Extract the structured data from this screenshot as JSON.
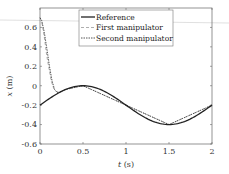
{
  "chart_data": {
    "type": "line",
    "title": "",
    "xlabel": "t (s)",
    "ylabel": "x (m)",
    "xlim": [
      0,
      2
    ],
    "ylim": [
      -0.6,
      0.8
    ],
    "xticks": [
      0,
      0.5,
      1,
      1.5,
      2
    ],
    "xtick_labels": [
      "0",
      "0.5",
      "1",
      "1.5",
      "2"
    ],
    "yticks": [
      -0.6,
      -0.4,
      -0.2,
      0,
      0.2,
      0.4,
      0.6
    ],
    "ytick_labels": [
      "-0.6",
      "-0.4",
      "-0.2",
      "0",
      "0.2",
      "0.4",
      "0.6"
    ],
    "grid": false,
    "legend_position": "upper center",
    "series": [
      {
        "name": "Reference",
        "style": "solid",
        "color": "#222222",
        "x": [
          0,
          0.1,
          0.2,
          0.3,
          0.4,
          0.5,
          0.6,
          0.7,
          0.8,
          0.9,
          1.0,
          1.1,
          1.2,
          1.3,
          1.4,
          1.5,
          1.6,
          1.7,
          1.8,
          1.9,
          2.0
        ],
        "y": [
          -0.2,
          -0.138,
          -0.082,
          -0.038,
          -0.01,
          0.0,
          -0.01,
          -0.038,
          -0.082,
          -0.138,
          -0.2,
          -0.262,
          -0.318,
          -0.362,
          -0.39,
          -0.4,
          -0.39,
          -0.362,
          -0.318,
          -0.262,
          -0.2
        ]
      },
      {
        "name": "First manipulator",
        "style": "dashed",
        "color": "#999999",
        "x": [
          0,
          0.02,
          0.05,
          0.08,
          0.1,
          0.13,
          0.16,
          0.19,
          0.22,
          0.3,
          0.5,
          1.0,
          1.5,
          2.0
        ],
        "y": [
          0.7,
          0.66,
          0.5,
          0.3,
          0.2,
          0.05,
          -0.03,
          -0.06,
          -0.065,
          -0.038,
          0.0,
          -0.2,
          -0.4,
          -0.2
        ]
      },
      {
        "name": "Second manipulator",
        "style": "dashdot",
        "color": "#444444",
        "x": [
          0,
          0.02,
          0.05,
          0.08,
          0.11,
          0.14,
          0.17,
          0.2,
          0.23,
          0.3,
          0.5,
          1.0,
          1.5,
          2.0
        ],
        "y": [
          0.7,
          0.67,
          0.55,
          0.38,
          0.2,
          0.05,
          -0.04,
          -0.07,
          -0.065,
          -0.038,
          0.0,
          -0.2,
          -0.4,
          -0.2
        ]
      }
    ]
  },
  "legend": {
    "items": [
      "Reference",
      "First manipulator",
      "Second manipulator"
    ]
  },
  "axes": {
    "xlabel_italic": "t",
    "xlabel_unit": " (s)",
    "ylabel_italic": "x",
    "ylabel_unit": " (m)"
  }
}
